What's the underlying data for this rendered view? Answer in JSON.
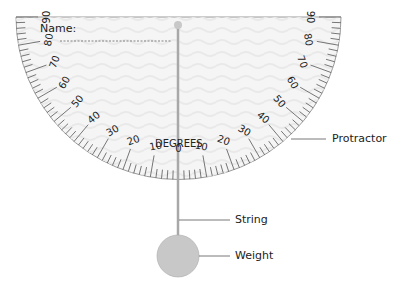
{
  "diagram": {
    "name_label": "Name:",
    "degrees_label": "DEGREES",
    "scale": {
      "left_ticks": [
        "90",
        "80",
        "70",
        "60",
        "50",
        "40",
        "30",
        "20",
        "10"
      ],
      "center_tick": "0",
      "right_ticks": [
        "10",
        "20",
        "30",
        "40",
        "50",
        "60",
        "70",
        "80",
        "90"
      ]
    },
    "callouts": {
      "protractor": "Protractor",
      "string": "String",
      "weight": "Weight"
    },
    "colors": {
      "protractor_fill": "#f4f4f4",
      "protractor_edge": "#9a9a9a",
      "string": "#a8a8a8",
      "weight": "#c8c8c8",
      "text": "#222222"
    }
  }
}
